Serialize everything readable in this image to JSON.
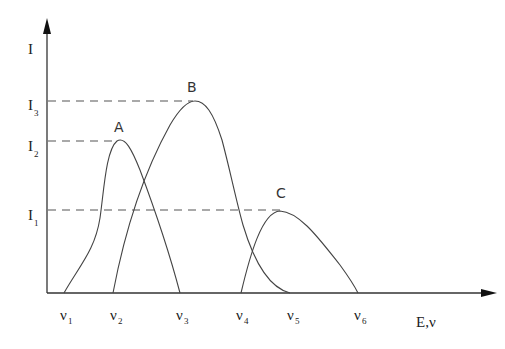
{
  "diagram": {
    "y_axis_label": "I",
    "x_axis_label": "E,ν",
    "y_ticks": [
      {
        "base": "I",
        "sub": "3"
      },
      {
        "base": "I",
        "sub": "2"
      },
      {
        "base": "I",
        "sub": "1"
      }
    ],
    "x_ticks": [
      {
        "base": "ν",
        "sub": "1"
      },
      {
        "base": "ν",
        "sub": "2"
      },
      {
        "base": "ν",
        "sub": "3"
      },
      {
        "base": "ν",
        "sub": "4"
      },
      {
        "base": "ν",
        "sub": "5"
      },
      {
        "base": "ν",
        "sub": "6"
      }
    ],
    "peaks": [
      {
        "label": "A",
        "start": "ν1",
        "end": "ν3",
        "max": "I2"
      },
      {
        "label": "B",
        "start": "ν2",
        "end": "ν5",
        "max": "I3"
      },
      {
        "label": "C",
        "start": "ν4",
        "end": "ν6",
        "max": "I1"
      }
    ]
  }
}
